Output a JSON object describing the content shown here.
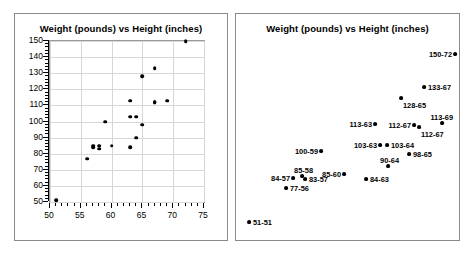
{
  "left_panel": {
    "title": "Weight (pounds) vs Height (inches)",
    "y_ticks": [
      "50",
      "60",
      "70",
      "80",
      "90",
      "100",
      "110",
      "120",
      "130",
      "140",
      "150"
    ],
    "x_ticks": [
      "50",
      "55",
      "60",
      "65",
      "70",
      "75"
    ]
  },
  "right_panel": {
    "title": "Weight (pounds) vs Height (inches)"
  },
  "chart_data": [
    {
      "type": "scatter",
      "title": "Weight (pounds) vs Height (inches)",
      "xlabel": "",
      "ylabel": "",
      "xlim": [
        50,
        75
      ],
      "ylim": [
        50,
        150
      ],
      "x_ticks": [
        50,
        55,
        60,
        65,
        70,
        75
      ],
      "y_ticks": [
        50,
        60,
        70,
        80,
        90,
        100,
        110,
        120,
        130,
        140,
        150
      ],
      "grid": true,
      "legend": "none",
      "points": [
        {
          "x": 51,
          "y": 51
        },
        {
          "x": 56,
          "y": 77
        },
        {
          "x": 57,
          "y": 84
        },
        {
          "x": 57,
          "y": 85
        },
        {
          "x": 58,
          "y": 85
        },
        {
          "x": 58,
          "y": 83
        },
        {
          "x": 59,
          "y": 100
        },
        {
          "x": 60,
          "y": 85
        },
        {
          "x": 63,
          "y": 84
        },
        {
          "x": 63,
          "y": 113
        },
        {
          "x": 63,
          "y": 103
        },
        {
          "x": 64,
          "y": 103
        },
        {
          "x": 64,
          "y": 90
        },
        {
          "x": 65,
          "y": 128
        },
        {
          "x": 65,
          "y": 98
        },
        {
          "x": 67,
          "y": 133
        },
        {
          "x": 67,
          "y": 112
        },
        {
          "x": 67,
          "y": 112
        },
        {
          "x": 69,
          "y": 113
        },
        {
          "x": 72,
          "y": 150
        }
      ]
    },
    {
      "type": "scatter",
      "title": "Weight (pounds) vs Height (inches)",
      "xlabel": "",
      "ylabel": "",
      "grid": false,
      "legend": "none",
      "note": "same data as left panel, each point annotated with weight-height",
      "points": [
        {
          "label": "51-51",
          "x": 51,
          "y": 51,
          "px": 12,
          "py": 207,
          "side": "right"
        },
        {
          "label": "77-56",
          "x": 56,
          "y": 77,
          "px": 49,
          "py": 173,
          "side": "right"
        },
        {
          "label": "84-57",
          "x": 57,
          "y": 84,
          "px": 56,
          "py": 163,
          "side": "left"
        },
        {
          "label": "85-58",
          "x": 58,
          "y": 85,
          "px": 65,
          "py": 161,
          "side": "above"
        },
        {
          "label": "83-57",
          "x": 57,
          "y": 83,
          "px": 68,
          "py": 164,
          "side": "right"
        },
        {
          "label": "100-59",
          "x": 59,
          "y": 100,
          "px": 84,
          "py": 136,
          "side": "left"
        },
        {
          "label": "85-60",
          "x": 60,
          "y": 85,
          "px": 107,
          "py": 159,
          "side": "left"
        },
        {
          "label": "84-63",
          "x": 63,
          "y": 84,
          "px": 129,
          "py": 164,
          "side": "right"
        },
        {
          "label": "113-63",
          "x": 63,
          "y": 113,
          "px": 138,
          "py": 109,
          "side": "left"
        },
        {
          "label": "103-63",
          "x": 63,
          "y": 103,
          "px": 143,
          "py": 130,
          "side": "left"
        },
        {
          "label": "103-64",
          "x": 64,
          "y": 103,
          "px": 150,
          "py": 130,
          "side": "right"
        },
        {
          "label": "90-64",
          "x": 64,
          "y": 90,
          "px": 151,
          "py": 151,
          "side": "above"
        },
        {
          "label": "98-65",
          "x": 65,
          "y": 98,
          "px": 172,
          "py": 139,
          "side": "right"
        },
        {
          "label": "128-65",
          "x": 65,
          "y": 128,
          "px": 164,
          "py": 83,
          "side": "below"
        },
        {
          "label": "112-67",
          "x": 67,
          "y": 112,
          "px": 177,
          "py": 110,
          "side": "left"
        },
        {
          "label": "112-67",
          "x": 67,
          "y": 112,
          "px": 182,
          "py": 112,
          "side": "below"
        },
        {
          "label": "133-67",
          "x": 67,
          "y": 133,
          "px": 187,
          "py": 72,
          "side": "right"
        },
        {
          "label": "113-69",
          "x": 69,
          "y": 113,
          "px": 205,
          "py": 108,
          "side": "above"
        },
        {
          "label": "150-72",
          "x": 72,
          "y": 150,
          "px": 218,
          "py": 39,
          "side": "left"
        }
      ]
    }
  ]
}
